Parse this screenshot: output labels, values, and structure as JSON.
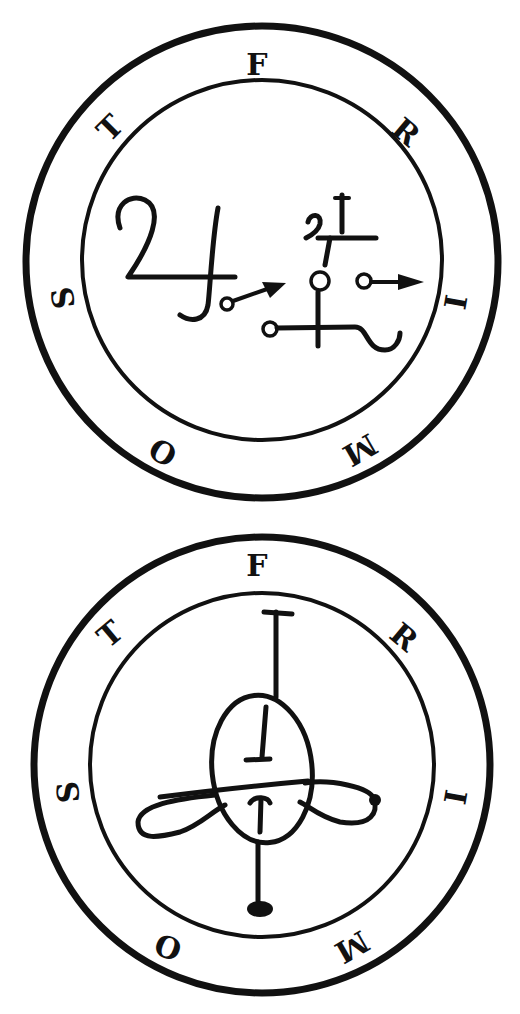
{
  "seals": [
    {
      "name": "FRIMOST",
      "position": "top",
      "letters": [
        "F",
        "R",
        "I",
        "M",
        "O",
        "S",
        "T"
      ],
      "figure": "sigil-with-arrows"
    },
    {
      "name": "FRIMOST",
      "position": "bottom",
      "letters": [
        "F",
        "R",
        "I",
        "M",
        "O",
        "S",
        "T"
      ],
      "figure": "oval-cross-with-loops",
      "inner_glyphs": [
        "I",
        "I"
      ]
    }
  ],
  "colors": {
    "ink": "#111111",
    "background": "#ffffff"
  }
}
